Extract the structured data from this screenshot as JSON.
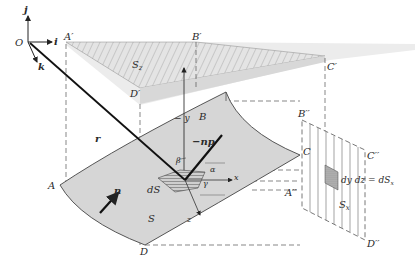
{
  "figure": {
    "colors": {
      "surface_fill": "#d9d9d9",
      "projection_fill": "#cfcfcf",
      "line": "#333333",
      "background": "#ffffff"
    }
  },
  "axes": {
    "origin": "O",
    "i": "i",
    "j": "j",
    "k": "k",
    "x": "x",
    "neg_y": "− y",
    "z": "z"
  },
  "labels": {
    "A_prime": "A′",
    "B_prime": "B′",
    "C_prime": "C′",
    "D_prime": "D′",
    "S_z": "S",
    "S_z_sub": "z",
    "A": "A",
    "B": "B",
    "C": "C",
    "D": "D",
    "S": "S",
    "dS": "dS",
    "r": "r",
    "n": "n",
    "neg_np": "−np",
    "alpha": "α",
    "beta": "β",
    "gamma": "γ",
    "A_dprime": "A′′",
    "B_dprime": "B′′",
    "C_dprime": "C′′",
    "D_dprime": "D′′",
    "S_x": "S",
    "S_x_sub": "x",
    "dydz_eq": "dy dz = dS",
    "dydz_sub": "x"
  }
}
